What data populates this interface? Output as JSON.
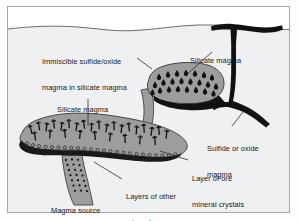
{
  "figure": {
    "type": "geology-cross-section-diagram",
    "colors": {
      "background": "#ffffff",
      "ground": "#eef0f1",
      "magma_gray": "#9d9d9d",
      "magma_gray_dark": "#8e8e8e",
      "sulfide_black": "#111111",
      "outline": "#3a3a3a",
      "frame": "#a8a8ac",
      "text": "#1a1a1a"
    },
    "labels": [
      {
        "id": "immiscible-sulfide-oxide",
        "line1": "Immiscible sulfide/oxide",
        "line2": "magma in silicate magma",
        "x": 44,
        "y": 45,
        "leader_to_x": 152,
        "leader_to_y": 72
      },
      {
        "id": "silicate-magma-upper",
        "line1": "Silicate magma",
        "line2": "",
        "x": 190,
        "y": 43,
        "leader_to_x": 181,
        "leader_to_y": 74
      },
      {
        "id": "silicate-magma-lower",
        "line1": "Silicate magma",
        "line2": "",
        "x": 59,
        "y": 92,
        "leader_to_x": 88,
        "leader_to_y": 128
      },
      {
        "id": "sulfide-or-oxide-magma",
        "line1": "Sulfide or oxide",
        "line2": "magma",
        "x": 208,
        "y": 130,
        "leader_to_x": 243,
        "leader_to_y": 116
      },
      {
        "id": "layer-of-ore-mineral-crystals",
        "line1": "Layer of ore",
        "line2": "mineral crystals",
        "x": 192,
        "y": 161,
        "leader_to_x": 160,
        "leader_to_y": 152
      },
      {
        "id": "layers-of-other-minerals",
        "line1": "Layers of other",
        "line2": "minerals",
        "x": 126,
        "y": 178,
        "leader_to_x": 92,
        "leader_to_y": 162
      },
      {
        "id": "magma-source",
        "line1": "Magma source",
        "line2": "",
        "x": 52,
        "y": 192,
        "leader_to_x": 0,
        "leader_to_y": 0
      }
    ],
    "features": {
      "ground_surface_label": "ground surface",
      "upper_body_label": "upper magma chamber",
      "lower_body_label": "lower magma chamber",
      "dike_label": "sulfide oxide dike",
      "feeder_label": "magma source feeder",
      "droplets_label": "immiscible sulfide droplets",
      "crystals_label": "settling ore mineral crystals",
      "ore_layer_label": "accumulated ore layer"
    }
  }
}
